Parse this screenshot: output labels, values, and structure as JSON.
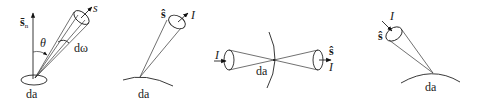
{
  "diagram": {
    "panels": [
      {
        "id": "panel-1",
        "labels": {
          "normal_vector": "s̄",
          "normal_subscript": "n",
          "direction": "s",
          "angle": "θ",
          "solid_angle": "dω",
          "area": "da"
        }
      },
      {
        "id": "panel-2",
        "labels": {
          "direction": "ŝ",
          "intensity": "I",
          "area": "da"
        }
      },
      {
        "id": "panel-3",
        "labels": {
          "intensity_in": "I",
          "direction": "ŝ",
          "intensity_out": "I",
          "area": "da"
        }
      },
      {
        "id": "panel-4",
        "labels": {
          "intensity": "I",
          "direction": "ŝ",
          "area": "da"
        }
      }
    ],
    "colors": {
      "line": "#222222",
      "background": "#ffffff"
    }
  }
}
